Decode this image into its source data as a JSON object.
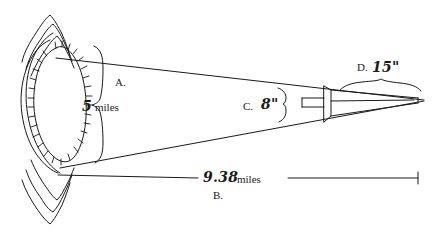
{
  "figure": {
    "background_color": "#ffffff",
    "ink_color": "#1a1a1a",
    "width_px": 445,
    "height_px": 234
  },
  "labels": {
    "a": "A.",
    "b": "B.",
    "c": "C.",
    "d": "D.",
    "five": "5",
    "miles_a": "miles",
    "eight_inches": "8\"",
    "fifteen_inches": "15\"",
    "distance_value": "9.38",
    "miles_b": "miles"
  },
  "annotations": {
    "left_object_height": "5 miles",
    "cone_length": "9.38 miles",
    "lens_aperture": "8\"",
    "eyepiece_length": "15\""
  },
  "icons": {
    "left_form": "crater-outline-icon",
    "upper_chevrons": "ridge-chevron-icon",
    "lower_chevrons": "ridge-chevron-icon",
    "vertical_brace": "curly-brace-vertical-icon",
    "aperture_brace": "curly-brace-vertical-icon",
    "eyepiece_brace": "curly-brace-horizontal-icon",
    "lens_plate": "lens-plate-icon",
    "dimension_line": "dimension-line-icon"
  }
}
